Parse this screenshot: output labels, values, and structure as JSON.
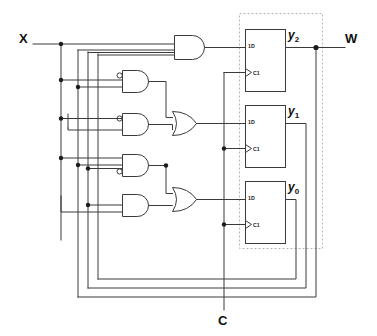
{
  "diagram": {
    "type": "logic-circuit",
    "colors": {
      "wire": "#3a3a3a",
      "junction": "#1c1c1c",
      "dashed_border": "#b5b5b5",
      "background": "#ffffff",
      "text": "#111111"
    }
  },
  "ports": {
    "input_x": "X",
    "input_c": "C",
    "output_w": "W"
  },
  "state_outputs": [
    {
      "name": "y",
      "subscript": "2"
    },
    {
      "name": "y",
      "subscript": "1"
    },
    {
      "name": "y",
      "subscript": "0"
    }
  ],
  "flipflops": [
    {
      "id": "ff-y2",
      "data_pin": "1D",
      "clock_pin": "C1",
      "output_label_base": "y",
      "output_label_sub": "2"
    },
    {
      "id": "ff-y1",
      "data_pin": "1D",
      "clock_pin": "C1",
      "output_label_base": "y",
      "output_label_sub": "1"
    },
    {
      "id": "ff-y0",
      "data_pin": "1D",
      "clock_pin": "C1",
      "output_label_base": "y",
      "output_label_sub": "0"
    }
  ],
  "gates": [
    {
      "id": "and-1",
      "kind": "AND",
      "inputs": 3,
      "inverted_inputs": []
    },
    {
      "id": "and-2",
      "kind": "AND",
      "inputs": 2,
      "inverted_inputs": [
        0
      ]
    },
    {
      "id": "and-3",
      "kind": "AND",
      "inputs": 2,
      "inverted_inputs": [
        0
      ]
    },
    {
      "id": "and-4",
      "kind": "AND",
      "inputs": 3,
      "inverted_inputs": [
        2
      ]
    },
    {
      "id": "and-5",
      "kind": "AND",
      "inputs": 2,
      "inverted_inputs": []
    },
    {
      "id": "or-1",
      "kind": "OR",
      "inputs": 2,
      "inverted_inputs": []
    },
    {
      "id": "or-2",
      "kind": "OR",
      "inputs": 2,
      "inverted_inputs": []
    }
  ]
}
